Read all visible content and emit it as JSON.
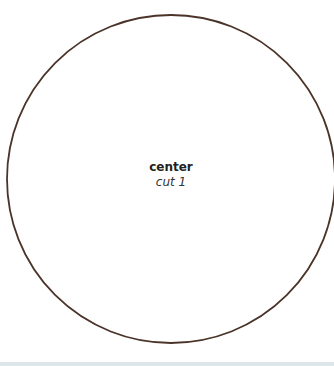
{
  "diagram": {
    "shape": "circle",
    "stroke_color": "#4a3328",
    "fill_color": "#ffffff",
    "label": {
      "title": "center",
      "subtitle": "cut 1"
    }
  }
}
